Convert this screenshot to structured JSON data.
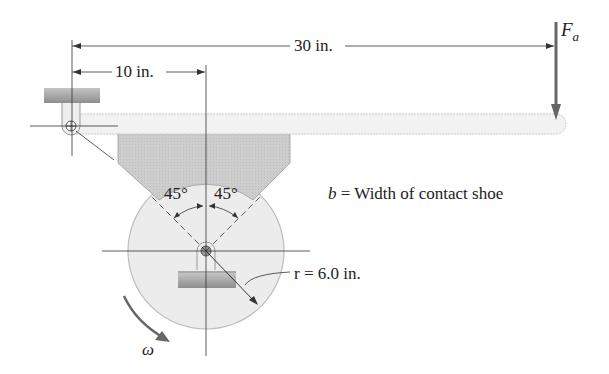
{
  "diagram": {
    "type": "block brake schematic",
    "dimensions": {
      "overall": "30 in.",
      "shoe_offset": "10 in.",
      "radius": "r = 6.0 in."
    },
    "angles": {
      "left": "45°",
      "right": "45°"
    },
    "force": {
      "symbol": "F",
      "subscript": "a"
    },
    "legend": {
      "symbol": "b",
      "text": " = Width of contact shoe"
    },
    "rotation": {
      "symbol": "ω"
    },
    "colors": {
      "line": "#333333",
      "wheel_fill": "#ececec",
      "wheel_stroke": "#b8b8b8",
      "shoe_fill": "#cfcfcf",
      "lever_fill": "#f1f1f1",
      "ground_fill": "#a9a9a9",
      "arrow": "#666666"
    }
  }
}
